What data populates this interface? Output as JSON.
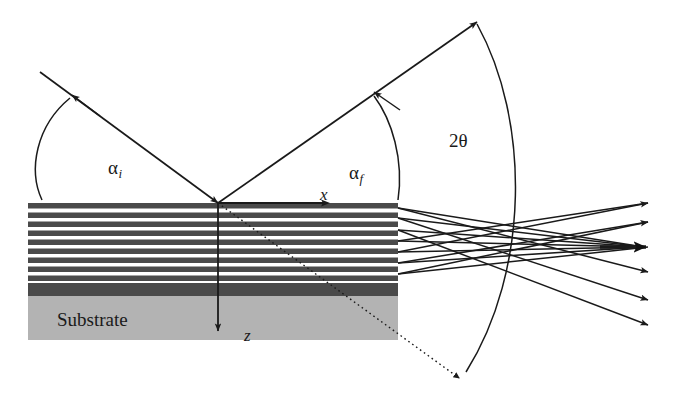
{
  "figure": {
    "background_color": "#ffffff",
    "width": 680,
    "height": 397
  },
  "labels": {
    "alpha_incident": "α",
    "alpha_incident_sub": "i",
    "alpha_final": "α",
    "alpha_final_sub": "f",
    "two_theta": "2θ",
    "x_axis": "x",
    "z_axis": "z",
    "substrate": "Substrate"
  },
  "sample": {
    "left": 28,
    "right": 398,
    "surface_y": 203,
    "buffer_top": 283,
    "buffer_bottom": 296,
    "substrate_bottom": 340,
    "multilayer_dark_color": "#4a4a4a",
    "multilayer_light_color": "#ffffff",
    "buffer_color": "#4a4a4a",
    "substrate_color": "#b3b3b3",
    "bilayer_count": 9,
    "dark_layer_thickness": 5,
    "light_layer_thickness": 4
  },
  "beams": {
    "stroke_color": "#1a1a1a",
    "incident": {
      "from_x": 40,
      "from_y": 72,
      "to_x": 218,
      "to_y": 203,
      "arrow_x": 75,
      "arrow_y": 98
    },
    "exit": {
      "from_x": 218,
      "from_y": 203,
      "to_x": 477,
      "to_y": 22,
      "arrow_x": 378,
      "arrow_y": 94
    },
    "transmitted_dotted": {
      "from_x": 218,
      "from_y": 203,
      "to_x": 463,
      "to_y": 382
    },
    "z_axis_arrow": {
      "x": 218,
      "from_y": 203,
      "to_y": 331
    },
    "x_axis_arrow": {
      "y": 203,
      "from_x": 218,
      "to_x": 330
    }
  },
  "arcs": {
    "alpha_i_arc": "from surface to incident beam",
    "alpha_f_arc": "from surface to exit beam",
    "two_theta_arc": "from exit beam to transmitted beam"
  },
  "scattered_fan": {
    "description": "Crossing bundle of scattered rays from layer interfaces converging to seven arrowheads at right",
    "origin_x": 398,
    "tip_x": 654,
    "origin_ys": [
      208,
      218,
      230,
      241,
      252,
      263,
      274
    ],
    "tip_ys": [
      203,
      222,
      247,
      272,
      300,
      325,
      247
    ],
    "bold_tip_index": 2,
    "ray_count": 12
  },
  "colors": {
    "ink": "#1a1a1a",
    "dark_layer": "#4a4a4a",
    "substrate_gray": "#b3b3b3"
  }
}
